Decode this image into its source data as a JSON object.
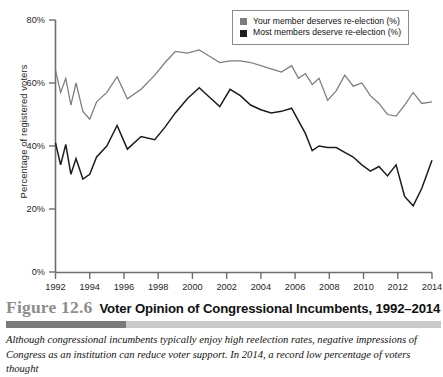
{
  "figure": {
    "number_label": "Figure 12.6",
    "title": "Voter Opinion of Congressional Incumbents, 1992–2014",
    "caption": "Although congressional incumbents typically enjoy high reelection rates, negative impressions of Congress as an institution can reduce voter support. In 2014, a record low percentage of voters thought",
    "rule_dark_color": "#7a7a7a",
    "rule_light_color": "#c9c9c9"
  },
  "legend": {
    "position": "top-right",
    "entries": [
      {
        "label": "Your member deserves re-election (%)",
        "swatch_name": "legend-swatch-your-member",
        "color": "#7d7d7d"
      },
      {
        "label": "Most members deserve re-election (%)",
        "swatch_name": "legend-swatch-most-members",
        "color": "#1c1c1c"
      }
    ]
  },
  "chart_data": {
    "type": "line",
    "title": "Voter Opinion of Congressional Incumbents, 1992–2014",
    "xlabel": "",
    "ylabel": "Percentage of registered voters",
    "xlim": [
      1992,
      2014
    ],
    "ylim": [
      0,
      80
    ],
    "grid": false,
    "legend_position": "top-right",
    "y_tick_labels": [
      "0%",
      "20%",
      "40%",
      "60%",
      "80%"
    ],
    "y_ticks": [
      0,
      20,
      40,
      60,
      80
    ],
    "x_tick_labels": [
      "1992",
      "1994",
      "1996",
      "1998",
      "2000",
      "2002",
      "2004",
      "2006",
      "2008",
      "2010",
      "2012",
      "2014"
    ],
    "x_ticks": [
      1992,
      1994,
      1996,
      1998,
      2000,
      2002,
      2004,
      2006,
      2008,
      2010,
      2012,
      2014
    ],
    "series": [
      {
        "name": "Your member deserves re-election (%)",
        "color": "#7d7d7d",
        "stroke_width": 1.25,
        "x": [
          1992.0,
          1992.3,
          1992.6,
          1992.9,
          1993.2,
          1993.6,
          1994.0,
          1994.4,
          1995.0,
          1995.6,
          1996.2,
          1997.0,
          1997.8,
          1998.4,
          1999.0,
          1999.7,
          2000.4,
          2001.0,
          2001.6,
          2002.2,
          2002.8,
          2003.4,
          2004.0,
          2004.6,
          2005.2,
          2005.8,
          2006.2,
          2006.6,
          2007.0,
          2007.4,
          2007.9,
          2008.4,
          2008.9,
          2009.4,
          2009.9,
          2010.4,
          2010.9,
          2011.4,
          2011.9,
          2012.4,
          2012.9,
          2013.4,
          2014.0
        ],
        "y": [
          64.0,
          57.0,
          61.5,
          53.0,
          60.0,
          51.0,
          48.5,
          54.0,
          57.0,
          62.0,
          55.0,
          58.0,
          62.5,
          66.5,
          70.0,
          69.5,
          70.5,
          68.5,
          66.5,
          67.0,
          67.0,
          66.5,
          65.5,
          64.5,
          63.5,
          65.5,
          61.5,
          63.0,
          59.5,
          61.5,
          54.5,
          57.5,
          62.5,
          59.0,
          60.0,
          56.0,
          53.5,
          50.0,
          49.5,
          53.0,
          57.0,
          53.5,
          54.0
        ],
        "annotations": {
          "start_value": 64.0,
          "peak_value": 70.5,
          "end_value": 47.0
        }
      },
      {
        "name": "Most members deserve re-election (%)",
        "color": "#1c1c1c",
        "stroke_width": 1.5,
        "x": [
          1992.0,
          1992.3,
          1992.6,
          1992.9,
          1993.2,
          1993.6,
          1994.0,
          1994.4,
          1995.0,
          1995.6,
          1996.2,
          1997.0,
          1997.8,
          1998.4,
          1999.0,
          1999.7,
          2000.4,
          2001.0,
          2001.6,
          2002.2,
          2002.8,
          2003.4,
          2004.0,
          2004.6,
          2005.2,
          2005.8,
          2006.2,
          2006.6,
          2007.0,
          2007.4,
          2007.9,
          2008.4,
          2008.9,
          2009.4,
          2009.9,
          2010.4,
          2010.9,
          2011.4,
          2011.9,
          2012.4,
          2012.9,
          2013.4,
          2014.0
        ],
        "y": [
          41.0,
          34.0,
          40.5,
          31.0,
          36.0,
          29.5,
          31.0,
          36.5,
          40.0,
          46.5,
          39.0,
          43.0,
          42.0,
          46.0,
          50.5,
          55.0,
          58.5,
          55.5,
          52.5,
          58.0,
          56.0,
          53.0,
          51.5,
          50.5,
          51.0,
          52.0,
          48.0,
          44.0,
          38.5,
          40.0,
          39.5,
          39.5,
          38.0,
          36.5,
          34.0,
          32.0,
          33.5,
          30.5,
          34.0,
          24.0,
          21.0,
          26.5,
          35.5
        ],
        "annotations": {
          "start_value": 41.0,
          "peak_value": 58.5,
          "end_value": 18.0
        }
      }
    ]
  }
}
